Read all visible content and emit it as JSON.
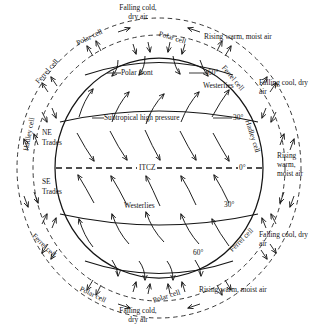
{
  "diagram": {
    "type": "meteorology-schematic",
    "colors": {
      "ink": "#151515",
      "background": "#ffffff"
    }
  },
  "globe": {
    "interior_labels": {
      "polar_front": "Polar front",
      "westerlies_north": "Westerlies",
      "subtropical_high": "Subtropical high pressure",
      "ne_trades": "NE\nTrades",
      "ne_trades_l1": "NE",
      "ne_trades_l2": "Trades",
      "itcz": "ITCZ",
      "se_trades_l1": "SE",
      "se_trades_l2": "Trades",
      "westerlies_south": "Westerlies"
    },
    "latitude_marks": [
      {
        "id": "lat-60-north",
        "value": "60°"
      },
      {
        "id": "lat-30-north",
        "value": "30°"
      },
      {
        "id": "lat-0-equator",
        "value": "0°"
      },
      {
        "id": "lat-30-south",
        "value": "30°"
      },
      {
        "id": "lat-60-south",
        "value": "60°"
      }
    ]
  },
  "cells": {
    "polar_top_left": "Polar cell",
    "polar_top_right": "Polar cell",
    "ferrel_top_left": "Ferrel cell",
    "ferrel_top_right": "Ferrel cell",
    "hadley_left": "Hadley cell",
    "hadley_right": "Hadley cell",
    "ferrel_bottom_left": "Ferrel cell",
    "ferrel_bottom_right": "Ferrel cell",
    "polar_bottom_left": "Polar cell",
    "polar_bottom_right": "Polar cell"
  },
  "air_masses": {
    "top_falling_l1": "Falling cold,",
    "top_falling_l2": "dry air",
    "top_rising": "Rising warm, moist air",
    "right_upper_falling_l1": "Falling cool, dry",
    "right_upper_falling_l2": "air",
    "right_mid_rising_l1": "Rising",
    "right_mid_rising_l2": "warm,",
    "right_mid_rising_l3": "moist air",
    "right_lower_falling_l1": "Falling cool, dry",
    "right_lower_falling_l2": "air",
    "bottom_rising": "Rising warm, moist air",
    "bottom_falling_l1": "Falling cold,",
    "bottom_falling_l2": "dry air"
  }
}
